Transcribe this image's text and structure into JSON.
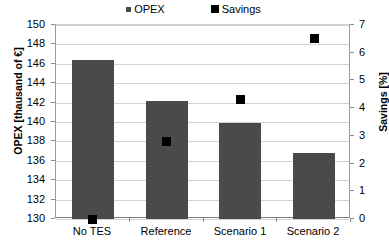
{
  "chart_data": {
    "type": "bar",
    "title": "",
    "categories": [
      "No TES",
      "Reference",
      "Scenario 1",
      "Scenario 2"
    ],
    "series": [
      {
        "name": "OPEX",
        "axis": "left",
        "render": "bar",
        "color": "#4a4a4a",
        "values": [
          146.4,
          142.2,
          139.9,
          136.8
        ]
      },
      {
        "name": "Savings",
        "axis": "right",
        "render": "scatter-square",
        "color": "#000000",
        "values": [
          0,
          2.8,
          4.3,
          6.5
        ]
      }
    ],
    "xlabel": "",
    "ylabel": "OPEX [thausand of €]",
    "y2label": "Savings [%]",
    "ylim": [
      130,
      150
    ],
    "y2lim": [
      0,
      7
    ],
    "yticks": [
      130,
      132,
      134,
      136,
      138,
      140,
      142,
      144,
      146,
      148,
      150
    ],
    "y2ticks": [
      0,
      1,
      2,
      3,
      4,
      5,
      6,
      7
    ],
    "grid": true,
    "legend_position": "top"
  },
  "legend": {
    "entries": [
      {
        "label": "OPEX",
        "swatch": "small-square-gray"
      },
      {
        "label": "Savings",
        "swatch": "square-black"
      }
    ]
  },
  "axes": {
    "left_title": "OPEX [thausand of €]",
    "right_title": "Savings [%]",
    "left_ticks": [
      "130",
      "132",
      "134",
      "136",
      "138",
      "140",
      "142",
      "144",
      "146",
      "148",
      "150"
    ],
    "right_ticks": [
      "0",
      "1",
      "2",
      "3",
      "4",
      "5",
      "6",
      "7"
    ]
  },
  "categories": [
    "No TES",
    "Reference",
    "Scenario 1",
    "Scenario 2"
  ]
}
